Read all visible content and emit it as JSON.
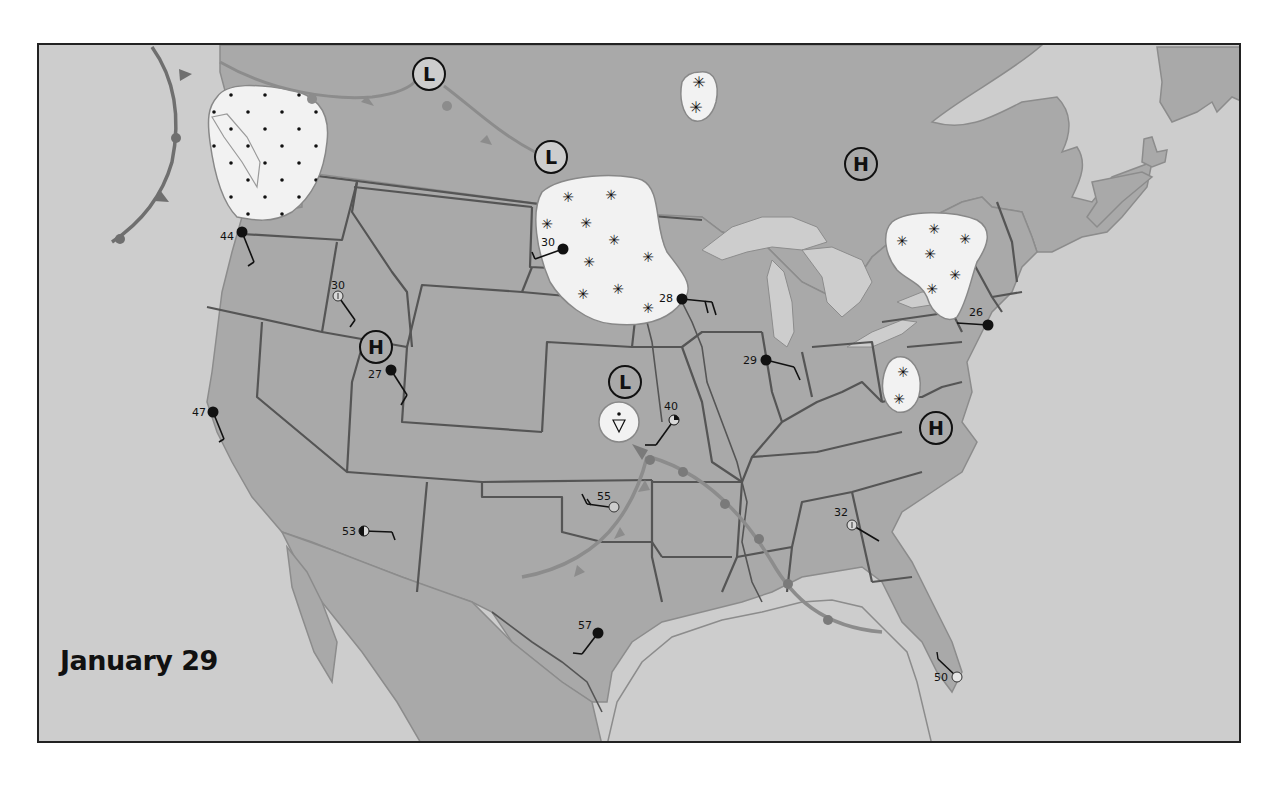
{
  "map": {
    "title": "January 29",
    "colors": {
      "ocean": "#cdcdcd",
      "land": "#a9a9a9",
      "lakes": "#cdcdcd",
      "borders": "#555555",
      "precip_area": "#f2f2f2",
      "front": "#7a7a7a",
      "symbol": "#111111"
    },
    "pressure_centers": [
      {
        "type": "L",
        "label": "L",
        "x": 427,
        "y": 72
      },
      {
        "type": "L",
        "label": "L",
        "x": 549,
        "y": 155
      },
      {
        "type": "H",
        "label": "H",
        "x": 859,
        "y": 162
      },
      {
        "type": "H",
        "label": "H",
        "x": 374,
        "y": 345
      },
      {
        "type": "L",
        "label": "L",
        "x": 623,
        "y": 380
      },
      {
        "type": "H",
        "label": "H",
        "x": 934,
        "y": 426
      }
    ],
    "precipitation_areas": [
      {
        "name": "pacific-northwest",
        "type": "rain",
        "symbol": "dot"
      },
      {
        "name": "hudson-bay-north",
        "type": "snow",
        "symbol": "asterisk"
      },
      {
        "name": "northern-plains",
        "type": "snow",
        "symbol": "asterisk"
      },
      {
        "name": "great-lakes-northeast",
        "type": "snow",
        "symbol": "asterisk"
      },
      {
        "name": "appalachians",
        "type": "snow",
        "symbol": "asterisk"
      },
      {
        "name": "kansas",
        "type": "showers",
        "symbol": "rain-shower"
      }
    ],
    "stations": [
      {
        "temp": "44",
        "x": 240,
        "y": 230,
        "cover": "overcast"
      },
      {
        "temp": "30",
        "x": 336,
        "y": 294,
        "cover": "obscured"
      },
      {
        "temp": "27",
        "x": 389,
        "y": 368,
        "cover": "overcast"
      },
      {
        "temp": "47",
        "x": 211,
        "y": 410,
        "cover": "overcast"
      },
      {
        "temp": "30",
        "x": 561,
        "y": 247,
        "cover": "overcast"
      },
      {
        "temp": "28",
        "x": 680,
        "y": 297,
        "cover": "overcast"
      },
      {
        "temp": "40",
        "x": 672,
        "y": 418,
        "cover": "quarter"
      },
      {
        "temp": "29",
        "x": 764,
        "y": 358,
        "cover": "overcast"
      },
      {
        "temp": "26",
        "x": 986,
        "y": 323,
        "cover": "overcast"
      },
      {
        "temp": "55",
        "x": 612,
        "y": 505,
        "cover": "clear"
      },
      {
        "temp": "53",
        "x": 362,
        "y": 529,
        "cover": "half"
      },
      {
        "temp": "32",
        "x": 850,
        "y": 523,
        "cover": "obscured"
      },
      {
        "temp": "57",
        "x": 596,
        "y": 631,
        "cover": "overcast"
      },
      {
        "temp": "50",
        "x": 955,
        "y": 675,
        "cover": "clear"
      }
    ],
    "fronts": [
      {
        "type": "occluded",
        "location": "pacific-offshore"
      },
      {
        "type": "occluded",
        "location": "northern-canada"
      },
      {
        "type": "cold",
        "location": "kansas-to-new-mexico"
      },
      {
        "type": "warm",
        "location": "kansas-to-gulf"
      }
    ]
  }
}
